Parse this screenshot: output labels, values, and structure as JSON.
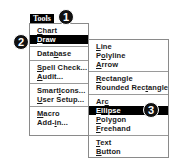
{
  "menu_bar": {
    "title": "Tools"
  },
  "tools_menu": {
    "items": [
      {
        "label": "Chart",
        "accel_index": 0
      },
      {
        "label": "Draw",
        "accel_index": 0,
        "selected": true
      },
      {
        "separator": true
      },
      {
        "label": "Database",
        "accel_index": 4
      },
      {
        "separator": true
      },
      {
        "label": "Spell Check...",
        "accel_index": 0
      },
      {
        "label": "Audit...",
        "accel_index": 0
      },
      {
        "separator": true
      },
      {
        "label": "SmartIcons...",
        "accel_index": 5
      },
      {
        "label": "User Setup...",
        "accel_index": 0
      },
      {
        "separator": true
      },
      {
        "label": "Macro",
        "accel_index": 0
      },
      {
        "label": "Add-in...",
        "accel_index": 4
      }
    ]
  },
  "draw_submenu": {
    "items": [
      {
        "label": "Line",
        "accel_index": 0
      },
      {
        "label": "Polyline",
        "accel_index": 1
      },
      {
        "label": "Arrow",
        "accel_index": 0
      },
      {
        "separator": true
      },
      {
        "label": "Rectangle",
        "accel_index": 0
      },
      {
        "label": "Rounded Rectangle",
        "accel_index": 11
      },
      {
        "separator": true
      },
      {
        "label": "Arc",
        "accel_index": 2
      },
      {
        "label": "Ellipse",
        "accel_index": 0,
        "selected": true
      },
      {
        "label": "Polygon",
        "accel_index": 0
      },
      {
        "label": "Freehand",
        "accel_index": 0
      },
      {
        "separator": true
      },
      {
        "label": "Text",
        "accel_index": 0
      },
      {
        "label": "Button",
        "accel_index": 0
      }
    ]
  },
  "callouts": [
    {
      "number": "1",
      "target": "Tools"
    },
    {
      "number": "2",
      "target": "Draw"
    },
    {
      "number": "3",
      "target": "Ellipse"
    }
  ],
  "colors": {
    "highlight_bg": "#000000",
    "highlight_fg": "#ffffff",
    "menu_border": "#8a8a8a",
    "callout_bg": "#111111"
  }
}
